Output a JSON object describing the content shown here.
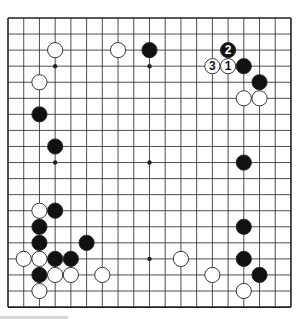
{
  "diagram": {
    "type": "go-board",
    "size": 19,
    "geometry": {
      "x0": 8,
      "y0": 18,
      "dx": 15.72,
      "dy": 16.06,
      "stone_radius": 7.6
    },
    "colors": {
      "background": "#ffffff",
      "line": "#222222",
      "black_stone": "#111111",
      "white_stone": "#ffffff",
      "stone_outline": "#222222",
      "footer_bar": "#d6d6d6"
    },
    "star_points": [
      [
        3,
        3
      ],
      [
        9,
        3
      ],
      [
        15,
        3
      ],
      [
        3,
        9
      ],
      [
        9,
        9
      ],
      [
        15,
        9
      ],
      [
        3,
        15
      ],
      [
        9,
        15
      ],
      [
        15,
        15
      ]
    ],
    "stones": [
      {
        "color": "white",
        "col": 3,
        "row": 2
      },
      {
        "color": "white",
        "col": 7,
        "row": 2
      },
      {
        "color": "black",
        "col": 9,
        "row": 2
      },
      {
        "color": "black",
        "col": 14,
        "row": 2,
        "label": "2"
      },
      {
        "color": "white",
        "col": 13,
        "row": 3,
        "label": "3"
      },
      {
        "color": "white",
        "col": 14,
        "row": 3,
        "label": "1"
      },
      {
        "color": "black",
        "col": 15,
        "row": 3
      },
      {
        "color": "white",
        "col": 2,
        "row": 4
      },
      {
        "color": "black",
        "col": 16,
        "row": 4
      },
      {
        "color": "white",
        "col": 15,
        "row": 5
      },
      {
        "color": "white",
        "col": 16,
        "row": 5
      },
      {
        "color": "black",
        "col": 2,
        "row": 6
      },
      {
        "color": "black",
        "col": 3,
        "row": 8
      },
      {
        "color": "black",
        "col": 15,
        "row": 9
      },
      {
        "color": "white",
        "col": 2,
        "row": 12
      },
      {
        "color": "black",
        "col": 3,
        "row": 12
      },
      {
        "color": "black",
        "col": 2,
        "row": 13
      },
      {
        "color": "black",
        "col": 15,
        "row": 13
      },
      {
        "color": "black",
        "col": 2,
        "row": 14
      },
      {
        "color": "black",
        "col": 5,
        "row": 14
      },
      {
        "color": "white",
        "col": 1,
        "row": 15
      },
      {
        "color": "white",
        "col": 2,
        "row": 15
      },
      {
        "color": "black",
        "col": 3,
        "row": 15
      },
      {
        "color": "black",
        "col": 4,
        "row": 15
      },
      {
        "color": "white",
        "col": 11,
        "row": 15
      },
      {
        "color": "black",
        "col": 15,
        "row": 15
      },
      {
        "color": "black",
        "col": 2,
        "row": 16
      },
      {
        "color": "white",
        "col": 3,
        "row": 16
      },
      {
        "color": "white",
        "col": 4,
        "row": 16
      },
      {
        "color": "white",
        "col": 6,
        "row": 16
      },
      {
        "color": "white",
        "col": 13,
        "row": 16
      },
      {
        "color": "black",
        "col": 16,
        "row": 16
      },
      {
        "color": "white",
        "col": 2,
        "row": 17
      },
      {
        "color": "white",
        "col": 15,
        "row": 17
      }
    ],
    "move_labels": [
      "1",
      "2",
      "3"
    ]
  }
}
